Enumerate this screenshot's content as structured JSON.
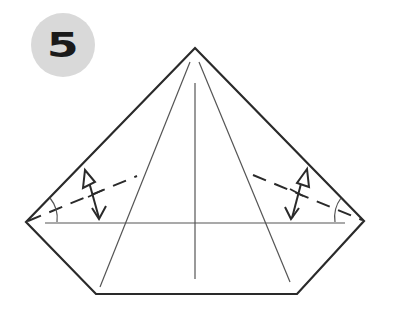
{
  "step": {
    "number": "5",
    "badge_color": "#d9d9d9",
    "number_color": "#1a1a1a"
  },
  "diagram": {
    "colors": {
      "outline": "#2a2a2a",
      "crease": "#555555",
      "dashed": "#2a2a2a",
      "arrow": "#2a2a2a"
    },
    "outline_points": [
      [
        195,
        48
      ],
      [
        364,
        221
      ],
      [
        297,
        294
      ],
      [
        96,
        294
      ],
      [
        26,
        222
      ]
    ],
    "creases": [
      {
        "name": "left-diagonal-crease",
        "from": [
          190,
          62
        ],
        "to": [
          100,
          287
        ]
      },
      {
        "name": "right-diagonal-crease",
        "from": [
          199,
          62
        ],
        "to": [
          290,
          282
        ]
      },
      {
        "name": "center-vertical-crease",
        "from": [
          195,
          83
        ],
        "to": [
          195,
          279
        ]
      },
      {
        "name": "horizontal-crease",
        "from": [
          45,
          223
        ],
        "to": [
          345,
          223
        ]
      }
    ],
    "dashed_lines": [
      {
        "name": "left-valley-fold-line",
        "from": [
          26,
          222
        ],
        "to": [
          137,
          176
        ]
      },
      {
        "name": "right-valley-fold-line",
        "from": [
          253,
          175
        ],
        "to": [
          364,
          221
        ]
      }
    ],
    "arrows": [
      {
        "name": "left-fold-unfold-arrow",
        "hollow_head": [
          85,
          172
        ],
        "point_head": [
          100,
          220
        ]
      },
      {
        "name": "right-fold-unfold-arrow",
        "hollow_head": [
          307,
          170
        ],
        "point_head": [
          291,
          220
        ]
      }
    ],
    "angle_marks": [
      {
        "name": "left-angle-bisector-arc",
        "center": [
          26,
          222
        ]
      },
      {
        "name": "right-angle-bisector-arc",
        "center": [
          364,
          221
        ]
      }
    ]
  }
}
